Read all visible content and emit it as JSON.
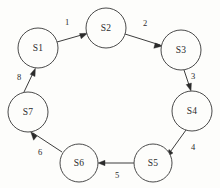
{
  "diagram": {
    "background_color": "#fdfdfb",
    "node_stroke_color": "#4a4a4a",
    "edge_color": "#3d3d3d",
    "text_color": "#2b2b2b",
    "nodes": [
      {
        "id": "S1",
        "label": "S1",
        "cx": 38,
        "cy": 48,
        "r": 20
      },
      {
        "id": "S2",
        "label": "S2",
        "cx": 106,
        "cy": 28,
        "r": 20
      },
      {
        "id": "S3",
        "label": "S3",
        "cx": 181,
        "cy": 50,
        "r": 20
      },
      {
        "id": "S4",
        "label": "S4",
        "cx": 192,
        "cy": 111,
        "r": 20
      },
      {
        "id": "S5",
        "label": "S5",
        "cx": 153,
        "cy": 163,
        "r": 19
      },
      {
        "id": "S6",
        "label": "S6",
        "cx": 79,
        "cy": 163,
        "r": 19
      },
      {
        "id": "S7",
        "label": "S7",
        "cx": 28,
        "cy": 112,
        "r": 20
      }
    ],
    "edges": [
      {
        "from": "S1",
        "to": "S2",
        "label": "1",
        "label_x": 67,
        "label_y": 22
      },
      {
        "from": "S2",
        "to": "S3",
        "label": "2",
        "label_x": 145,
        "label_y": 23
      },
      {
        "from": "S3",
        "to": "S4",
        "label": "3",
        "label_x": 193,
        "label_y": 76
      },
      {
        "from": "S5",
        "to": "S4",
        "label": "4",
        "label_x": 193,
        "label_y": 147
      },
      {
        "from": "S5",
        "to": "S6",
        "label": "5",
        "label_x": 117,
        "label_y": 175
      },
      {
        "from": "S6",
        "to": "S7",
        "label": "6",
        "label_x": 40,
        "label_y": 152
      },
      {
        "from": "S7",
        "to": "S1",
        "label": "8",
        "label_x": 19,
        "label_y": 77
      }
    ]
  }
}
